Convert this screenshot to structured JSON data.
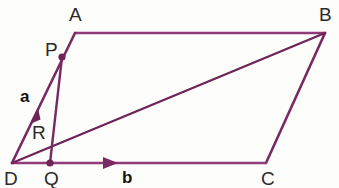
{
  "figure": {
    "type": "geometry-diagram",
    "shape": "parallelogram",
    "background_color": "#fdfdfc",
    "stroke_color": "#7a2a63",
    "stroke_color_light": "#9b4a85",
    "label_color": "#2b2b2b",
    "vector_label_color": "#151515",
    "canvas": {
      "width": 339,
      "height": 188
    }
  },
  "points": {
    "A": {
      "label": "A",
      "x": 75,
      "y": 33,
      "label_x": 69,
      "label_y": 5
    },
    "B": {
      "label": "B",
      "x": 325,
      "y": 33,
      "label_x": 319,
      "label_y": 5
    },
    "C": {
      "label": "C",
      "x": 266,
      "y": 163,
      "label_x": 261,
      "label_y": 169
    },
    "D": {
      "label": "D",
      "x": 12,
      "y": 163,
      "label_x": 4,
      "label_y": 169
    },
    "P": {
      "label": "P",
      "x": 62,
      "y": 57,
      "label_x": 45,
      "label_y": 40,
      "dot": true
    },
    "Q": {
      "label": "Q",
      "x": 50,
      "y": 163,
      "label_x": 44,
      "label_y": 169,
      "dot": true
    },
    "R": {
      "label": "R",
      "x": 53,
      "y": 138,
      "label_x": 32,
      "label_y": 123,
      "dot": false
    }
  },
  "segments": [
    {
      "name": "side-AB",
      "from": "A",
      "to": "B",
      "arrow": false
    },
    {
      "name": "side-BC",
      "from": "B",
      "to": "C",
      "arrow": false
    },
    {
      "name": "side-DC",
      "from": "D",
      "to": "C",
      "arrow": true,
      "arrow_at": 0.41
    },
    {
      "name": "side-DA",
      "from": "D",
      "to": "A",
      "arrow": true,
      "arrow_at": 0.4
    },
    {
      "name": "diagonal-DB",
      "from": "D",
      "to": "B",
      "arrow": false
    },
    {
      "name": "segment-PQ",
      "from": "P",
      "to": "Q",
      "arrow": false
    }
  ],
  "vectors": [
    {
      "name": "vector-a",
      "label": "a",
      "along": "DA",
      "label_x": 20,
      "label_y": 88
    },
    {
      "name": "vector-b",
      "label": "b",
      "along": "DC",
      "label_x": 122,
      "label_y": 169
    }
  ]
}
